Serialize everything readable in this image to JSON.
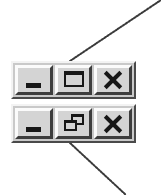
{
  "figure": {
    "background_color": "#ffffff"
  },
  "style": {
    "bar_face": "#c9c9c9",
    "button_face": "#d4d4d4",
    "highlight": "#fbfbfb",
    "shadow": "#3d3d3d",
    "glyph_color": "#171717",
    "leader_color": "#3a3a3a"
  },
  "bars": [
    {
      "id": "maximized-state-bar",
      "name": "restored-window-controls",
      "buttons": [
        {
          "name": "minimize-button",
          "icon": "minimize-icon",
          "label": "Minimize",
          "state": "normal"
        },
        {
          "name": "maximize-button",
          "icon": "maximize-icon",
          "label": "Maximize",
          "state": "normal"
        },
        {
          "name": "close-button",
          "icon": "close-icon",
          "label": "Close",
          "state": "normal"
        }
      ]
    },
    {
      "id": "restored-state-bar",
      "name": "maximized-window-controls",
      "buttons": [
        {
          "name": "minimize-button",
          "icon": "minimize-icon",
          "label": "Minimize",
          "state": "normal"
        },
        {
          "name": "restore-button",
          "icon": "restore-icon",
          "label": "Restore Down",
          "state": "normal"
        },
        {
          "name": "close-button",
          "icon": "close-icon",
          "label": "Close",
          "state": "normal"
        }
      ]
    }
  ],
  "leaders": [
    {
      "name": "maximize-callout-line",
      "points": "70,61 161,0",
      "target": "maximize-button",
      "style": "dotted"
    },
    {
      "name": "restore-callout-line",
      "points": "70,143 126,195",
      "target": "restore-button",
      "style": "dotted"
    }
  ]
}
